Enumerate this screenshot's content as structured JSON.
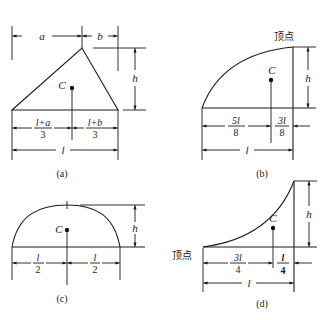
{
  "figures": {
    "a": {
      "caption": "(a)",
      "shape": "triangle",
      "dims": {
        "a": "a",
        "b": "b",
        "h": "h",
        "l": "l"
      },
      "centroid_label": "C",
      "left_segment": {
        "num": "l+a",
        "den": "3"
      },
      "right_segment": {
        "num": "l+b",
        "den": "3"
      }
    },
    "b": {
      "caption": "(b)",
      "shape": "half-parabola (concave)",
      "vertex_label": "顶点",
      "dims": {
        "h": "h",
        "l": "l"
      },
      "centroid_label": "C",
      "left_segment": {
        "num": "5l",
        "den": "8"
      },
      "right_segment": {
        "num": "3l",
        "den": "8"
      }
    },
    "c": {
      "caption": "(c)",
      "shape": "parabolic segment",
      "dims": {
        "h": "h",
        "l": "l"
      },
      "centroid_label": "C",
      "left_segment": {
        "num": "l",
        "den": "2"
      },
      "right_segment": {
        "num": "l",
        "den": "2"
      }
    },
    "d": {
      "caption": "(d)",
      "shape": "half-parabola (convex spandrel)",
      "vertex_label": "顶点",
      "dims": {
        "h": "h",
        "l": "l"
      },
      "centroid_label": "C",
      "left_segment": {
        "num": "3l",
        "den": "4"
      },
      "right_segment": {
        "num": "l",
        "den": "4"
      }
    }
  },
  "colors": {
    "ink": "#1a1a1a",
    "background": "#ffffff"
  }
}
